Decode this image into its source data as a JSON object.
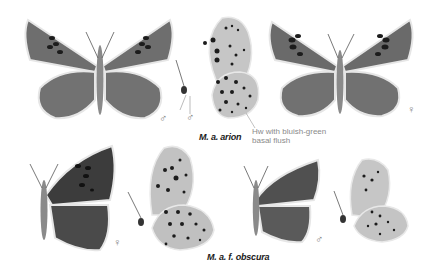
{
  "plate": {
    "rows": [
      {
        "label": "M. a. arion",
        "specimens": [
          {
            "view": "upperside",
            "sex_symbol": "♂",
            "tone": "#6e6e6e"
          },
          {
            "view": "underside",
            "sex_symbol": "",
            "tone": "#c4c4c4"
          },
          {
            "view": "upperside",
            "sex_symbol": "♀",
            "tone": "#6a6a6a"
          }
        ],
        "annotation": {
          "line1": "Hw with bluish-green",
          "line2": "basal flush"
        }
      },
      {
        "label": "M. a. f. obscura",
        "specimens": [
          {
            "view": "upperside-half",
            "sex_symbol": "♀",
            "tone": "#404040"
          },
          {
            "view": "underside",
            "sex_symbol": "",
            "tone": "#c0c0c0"
          },
          {
            "view": "upperside-half",
            "sex_symbol": "♂",
            "tone": "#555555"
          },
          {
            "view": "underside",
            "sex_symbol": "",
            "tone": "#c4c4c4"
          }
        ]
      }
    ]
  },
  "colors": {
    "background": "#ffffff",
    "wing_dark": "#3c3c3c",
    "wing_mid": "#6e6e6e",
    "underside": "#c6c6c6",
    "spot": "#1c1c1c",
    "annotation_text": "#8a8a8a"
  }
}
